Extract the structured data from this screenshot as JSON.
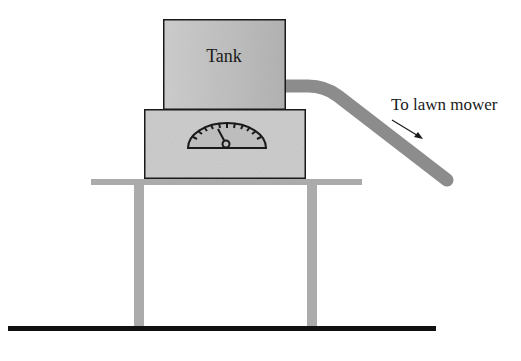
{
  "diagram": {
    "labels": {
      "tank": "Tank",
      "destination": "To lawn mower"
    },
    "colors": {
      "tank_fill": "#c4c4c4",
      "base_fill": "#cdcdcd",
      "gauge_fill": "#bdbdbd",
      "hose": "#8c8c8c",
      "table": "#ababab",
      "ground": "#111111",
      "outline": "#1a1a1a"
    },
    "elements": [
      {
        "name": "tank",
        "description": "Fuel tank box labeled Tank"
      },
      {
        "name": "gauge-base",
        "description": "Box under tank containing a semicircular dial gauge"
      },
      {
        "name": "dial-gauge",
        "description": "Semicircular gauge with tick marks and needle"
      },
      {
        "name": "hose",
        "description": "Hose from tank bending down toward the right"
      },
      {
        "name": "flow-arrow",
        "description": "Arrow pointing along hose direction"
      },
      {
        "name": "table",
        "description": "Table with top and two legs"
      },
      {
        "name": "ground",
        "description": "Ground line"
      }
    ]
  }
}
